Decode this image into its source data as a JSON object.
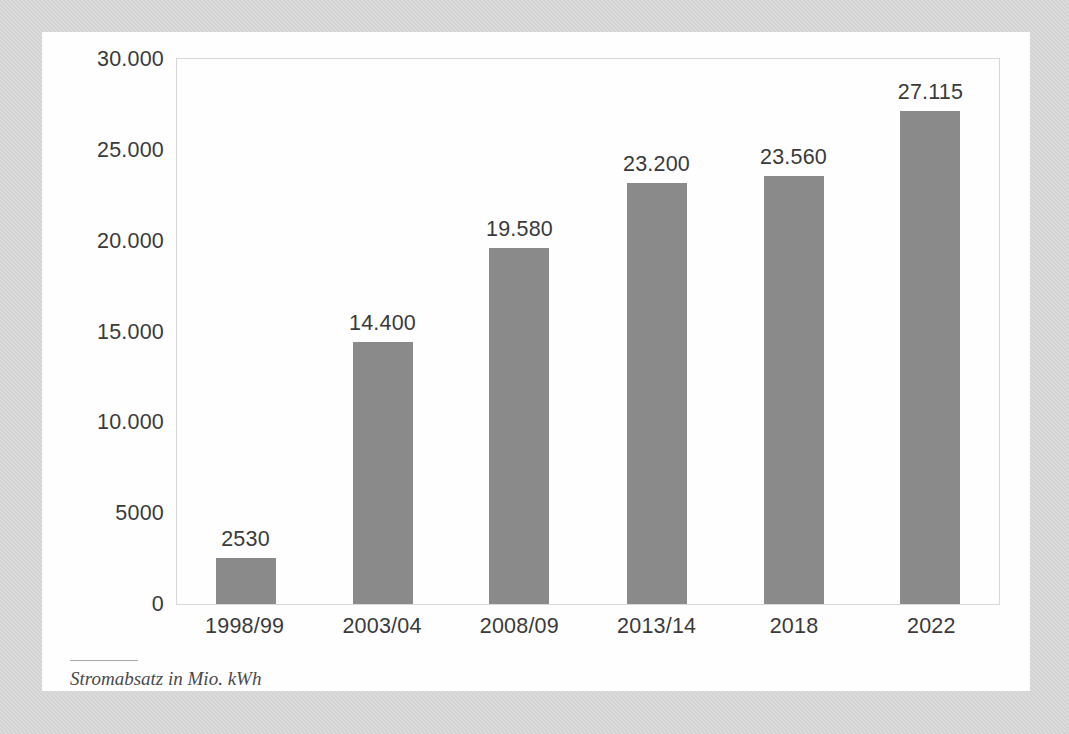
{
  "chart_data": {
    "type": "bar",
    "title": "",
    "subtitle": "",
    "caption": "Stromabsatz in Mio. kWh",
    "xlabel": "",
    "ylabel": "",
    "categories": [
      "1998/99",
      "2003/04",
      "2008/09",
      "2013/14",
      "2018",
      "2022"
    ],
    "values": [
      2530,
      14400,
      19580,
      23200,
      23560,
      27115
    ],
    "value_labels": [
      "2530",
      "14.400",
      "19.580",
      "23.200",
      "23.560",
      "27.115"
    ],
    "ylim": [
      0,
      30000
    ],
    "ytick_values": [
      0,
      5000,
      10000,
      15000,
      20000,
      25000,
      30000
    ],
    "ytick_labels": [
      "0",
      "5000",
      "10.000",
      "15.000",
      "20.000",
      "25.000",
      "30.000"
    ],
    "grid": false,
    "legend": null,
    "bar_color": "#8a8a8a",
    "frame_color": "#d8d8d8",
    "text_color": "#3a3a3a",
    "card_color": "#fefefe",
    "page_background": "#d2d2d2"
  }
}
